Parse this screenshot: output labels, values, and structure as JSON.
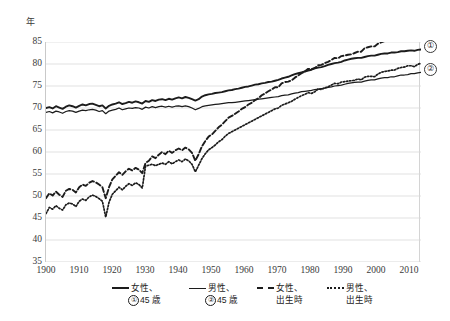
{
  "chart_data": {
    "type": "line",
    "title": "",
    "xlabel": "",
    "ylabel": "年",
    "unit_label": "年",
    "xlim": [
      1900,
      2013
    ],
    "ylim": [
      35,
      85
    ],
    "ytick_step": 5,
    "xtick_step": 10,
    "grid": "horizontal",
    "legend_position": "bottom",
    "xticks": [
      "1900",
      "1910",
      "1920",
      "1930",
      "1940",
      "1950",
      "1960",
      "1970",
      "1980",
      "1990",
      "2000",
      "2010"
    ],
    "yticks": [
      "85",
      "80",
      "75",
      "70",
      "65",
      "60",
      "55",
      "50",
      "45",
      "40",
      "35"
    ],
    "series": [
      {
        "name": "女性、①45歳",
        "key": "female_45",
        "style": "solid-thick",
        "callout": "①",
        "x": [
          1900,
          1901,
          1902,
          1903,
          1904,
          1905,
          1906,
          1907,
          1908,
          1909,
          1910,
          1911,
          1912,
          1913,
          1914,
          1915,
          1916,
          1917,
          1918,
          1919,
          1920,
          1921,
          1922,
          1923,
          1924,
          1925,
          1926,
          1927,
          1928,
          1929,
          1930,
          1931,
          1932,
          1933,
          1934,
          1935,
          1936,
          1937,
          1938,
          1939,
          1940,
          1941,
          1942,
          1943,
          1944,
          1945,
          1946,
          1947,
          1948,
          1949,
          1950,
          1951,
          1952,
          1953,
          1954,
          1955,
          1956,
          1957,
          1958,
          1959,
          1960,
          1961,
          1962,
          1963,
          1964,
          1965,
          1966,
          1967,
          1968,
          1969,
          1970,
          1971,
          1972,
          1973,
          1974,
          1975,
          1976,
          1977,
          1978,
          1979,
          1980,
          1981,
          1982,
          1983,
          1984,
          1985,
          1986,
          1987,
          1988,
          1989,
          1990,
          1991,
          1992,
          1993,
          1994,
          1995,
          1996,
          1997,
          1998,
          1999,
          2000,
          2001,
          2002,
          2003,
          2004,
          2005,
          2006,
          2007,
          2008,
          2009,
          2010,
          2011,
          2012,
          2013
        ],
        "y": [
          70.0,
          70.2,
          69.9,
          70.4,
          70.1,
          69.8,
          70.3,
          70.6,
          70.4,
          70.1,
          70.5,
          70.8,
          70.6,
          70.9,
          71.0,
          70.7,
          70.4,
          70.6,
          69.9,
          70.5,
          70.8,
          71.0,
          71.3,
          70.9,
          71.1,
          71.4,
          71.2,
          71.5,
          71.3,
          71.0,
          71.6,
          71.4,
          71.8,
          71.6,
          71.9,
          72.0,
          71.8,
          72.1,
          71.9,
          72.2,
          72.4,
          72.2,
          72.5,
          72.3,
          72.0,
          71.7,
          72.0,
          72.6,
          72.9,
          73.1,
          73.2,
          73.4,
          73.5,
          73.6,
          73.8,
          74.0,
          74.1,
          74.3,
          74.4,
          74.6,
          74.8,
          74.9,
          75.1,
          75.3,
          75.4,
          75.6,
          75.7,
          75.9,
          76.0,
          76.2,
          76.4,
          76.7,
          76.9,
          77.1,
          77.4,
          77.7,
          77.9,
          78.1,
          78.3,
          78.5,
          78.7,
          79.0,
          79.2,
          79.3,
          79.5,
          79.8,
          80.0,
          80.2,
          80.3,
          80.5,
          80.8,
          81.0,
          81.2,
          81.3,
          81.4,
          81.4,
          81.6,
          81.8,
          81.9,
          81.9,
          82.1,
          82.3,
          82.4,
          82.4,
          82.6,
          82.6,
          82.7,
          82.9,
          82.9,
          83.0,
          83.1,
          83.0,
          83.2,
          83.3
        ]
      },
      {
        "name": "男性、②45歳",
        "key": "male_45",
        "style": "solid-thin",
        "callout": "②",
        "x": [
          1900,
          1901,
          1902,
          1903,
          1904,
          1905,
          1906,
          1907,
          1908,
          1909,
          1910,
          1911,
          1912,
          1913,
          1914,
          1915,
          1916,
          1917,
          1918,
          1919,
          1920,
          1921,
          1922,
          1923,
          1924,
          1925,
          1926,
          1927,
          1928,
          1929,
          1930,
          1931,
          1932,
          1933,
          1934,
          1935,
          1936,
          1937,
          1938,
          1939,
          1940,
          1941,
          1942,
          1943,
          1944,
          1945,
          1946,
          1947,
          1948,
          1949,
          1950,
          1951,
          1952,
          1953,
          1954,
          1955,
          1956,
          1957,
          1958,
          1959,
          1960,
          1961,
          1962,
          1963,
          1964,
          1965,
          1966,
          1967,
          1968,
          1969,
          1970,
          1971,
          1972,
          1973,
          1974,
          1975,
          1976,
          1977,
          1978,
          1979,
          1980,
          1981,
          1982,
          1983,
          1984,
          1985,
          1986,
          1987,
          1988,
          1989,
          1990,
          1991,
          1992,
          1993,
          1994,
          1995,
          1996,
          1997,
          1998,
          1999,
          2000,
          2001,
          2002,
          2003,
          2004,
          2005,
          2006,
          2007,
          2008,
          2009,
          2010,
          2011,
          2012,
          2013
        ],
        "y": [
          69.0,
          69.2,
          68.9,
          69.3,
          69.1,
          68.8,
          69.2,
          69.4,
          69.3,
          69.0,
          69.3,
          69.5,
          69.4,
          69.6,
          69.7,
          69.5,
          69.2,
          69.4,
          68.7,
          69.3,
          69.5,
          69.7,
          70.0,
          69.6,
          69.8,
          70.0,
          69.9,
          70.1,
          70.0,
          69.7,
          70.2,
          70.0,
          70.3,
          70.1,
          70.3,
          70.4,
          70.2,
          70.4,
          70.2,
          70.4,
          70.5,
          70.3,
          70.5,
          70.3,
          70.0,
          69.6,
          69.9,
          70.3,
          70.5,
          70.6,
          70.7,
          70.8,
          70.9,
          71.0,
          71.1,
          71.2,
          71.2,
          71.3,
          71.4,
          71.5,
          71.6,
          71.7,
          71.8,
          71.9,
          72.0,
          72.1,
          72.2,
          72.3,
          72.4,
          72.5,
          72.6,
          72.8,
          72.9,
          73.0,
          73.2,
          73.4,
          73.5,
          73.7,
          73.8,
          73.9,
          74.0,
          74.2,
          74.3,
          74.4,
          74.5,
          74.7,
          74.8,
          75.0,
          75.1,
          75.2,
          75.4,
          75.6,
          75.7,
          75.8,
          75.9,
          75.9,
          76.1,
          76.3,
          76.4,
          76.4,
          76.6,
          76.8,
          76.9,
          76.9,
          77.1,
          77.1,
          77.3,
          77.5,
          77.5,
          77.6,
          77.8,
          77.8,
          78.0,
          78.1
        ]
      },
      {
        "name": "女性、出生時",
        "key": "female_birth",
        "style": "dashed",
        "callout": "",
        "x": [
          1900,
          1901,
          1902,
          1903,
          1904,
          1905,
          1906,
          1907,
          1908,
          1909,
          1910,
          1911,
          1912,
          1913,
          1914,
          1915,
          1916,
          1917,
          1918,
          1919,
          1920,
          1921,
          1922,
          1923,
          1924,
          1925,
          1926,
          1927,
          1928,
          1929,
          1930,
          1931,
          1932,
          1933,
          1934,
          1935,
          1936,
          1937,
          1938,
          1939,
          1940,
          1941,
          1942,
          1943,
          1944,
          1945,
          1946,
          1947,
          1948,
          1949,
          1950,
          1951,
          1952,
          1953,
          1954,
          1955,
          1956,
          1957,
          1958,
          1959,
          1960,
          1961,
          1962,
          1963,
          1964,
          1965,
          1966,
          1967,
          1968,
          1969,
          1970,
          1971,
          1972,
          1973,
          1974,
          1975,
          1976,
          1977,
          1978,
          1979,
          1980,
          1981,
          1982,
          1983,
          1984,
          1985,
          1986,
          1987,
          1988,
          1989,
          1990,
          1991,
          1992,
          1993,
          1994,
          1995,
          1996,
          1997,
          1998,
          1999,
          2000,
          2001,
          2002,
          2003,
          2004,
          2005,
          2006,
          2007,
          2008,
          2009,
          2010,
          2011,
          2012,
          2013
        ],
        "y": [
          49.5,
          50.6,
          50.1,
          51.0,
          50.3,
          49.8,
          51.2,
          51.6,
          51.4,
          50.8,
          52.0,
          52.6,
          52.3,
          53.0,
          53.4,
          53.1,
          52.6,
          52.0,
          49.5,
          52.0,
          53.8,
          54.6,
          55.4,
          54.8,
          55.6,
          56.2,
          55.8,
          56.4,
          56.0,
          55.2,
          57.5,
          58.0,
          59.0,
          58.6,
          59.4,
          60.0,
          59.5,
          60.3,
          59.8,
          60.4,
          60.8,
          60.4,
          61.0,
          60.6,
          59.8,
          58.0,
          59.5,
          61.3,
          62.5,
          63.5,
          64.0,
          64.8,
          65.6,
          66.2,
          67.0,
          67.8,
          68.2,
          68.7,
          69.2,
          69.8,
          70.2,
          70.8,
          71.2,
          71.8,
          72.2,
          72.9,
          73.3,
          73.8,
          74.2,
          74.7,
          74.7,
          75.6,
          75.9,
          76.0,
          76.3,
          76.9,
          77.4,
          77.9,
          78.3,
          78.9,
          78.8,
          79.1,
          79.7,
          79.8,
          80.2,
          80.5,
          80.9,
          81.4,
          81.3,
          81.8,
          81.9,
          82.1,
          82.2,
          82.5,
          82.8,
          82.8,
          83.6,
          83.8,
          84.0,
          84.0,
          84.6,
          84.9,
          85.2,
          85.3,
          85.6,
          85.5,
          85.8,
          86.0,
          86.1,
          86.4,
          86.3,
          85.9,
          86.4,
          86.6
        ]
      },
      {
        "name": "男性、出生時",
        "key": "male_birth",
        "style": "dotted",
        "callout": "",
        "x": [
          1900,
          1901,
          1902,
          1903,
          1904,
          1905,
          1906,
          1907,
          1908,
          1909,
          1910,
          1911,
          1912,
          1913,
          1914,
          1915,
          1916,
          1917,
          1918,
          1919,
          1920,
          1921,
          1922,
          1923,
          1924,
          1925,
          1926,
          1927,
          1928,
          1929,
          1930,
          1931,
          1932,
          1933,
          1934,
          1935,
          1936,
          1937,
          1938,
          1939,
          1940,
          1941,
          1942,
          1943,
          1944,
          1945,
          1946,
          1947,
          1948,
          1949,
          1950,
          1951,
          1952,
          1953,
          1954,
          1955,
          1956,
          1957,
          1958,
          1959,
          1960,
          1961,
          1962,
          1963,
          1964,
          1965,
          1966,
          1967,
          1968,
          1969,
          1970,
          1971,
          1972,
          1973,
          1974,
          1975,
          1976,
          1977,
          1978,
          1979,
          1980,
          1981,
          1982,
          1983,
          1984,
          1985,
          1986,
          1987,
          1988,
          1989,
          1990,
          1991,
          1992,
          1993,
          1994,
          1995,
          1996,
          1997,
          1998,
          1999,
          2000,
          2001,
          2002,
          2003,
          2004,
          2005,
          2006,
          2007,
          2008,
          2009,
          2010,
          2011,
          2012,
          2013
        ],
        "y": [
          46.0,
          47.4,
          47.0,
          47.8,
          47.2,
          46.8,
          48.0,
          48.4,
          48.2,
          47.6,
          48.8,
          49.3,
          49.0,
          49.8,
          50.2,
          49.9,
          49.4,
          48.8,
          45.2,
          48.6,
          50.4,
          51.2,
          52.0,
          51.4,
          52.2,
          52.8,
          52.4,
          53.0,
          52.6,
          51.8,
          56.8,
          57.0,
          57.2,
          56.9,
          57.2,
          57.5,
          57.2,
          57.8,
          57.3,
          57.8,
          58.2,
          57.8,
          58.4,
          58.0,
          57.2,
          55.5,
          57.0,
          58.5,
          59.6,
          60.5,
          61.0,
          61.6,
          62.3,
          62.8,
          63.6,
          64.2,
          64.6,
          65.0,
          65.4,
          65.8,
          66.2,
          66.6,
          67.0,
          67.4,
          67.8,
          68.2,
          68.6,
          69.0,
          69.4,
          69.8,
          70.0,
          70.6,
          70.9,
          71.2,
          71.5,
          72.0,
          72.4,
          72.8,
          73.1,
          73.5,
          73.3,
          73.7,
          74.3,
          74.2,
          74.6,
          74.8,
          75.2,
          75.6,
          75.5,
          75.9,
          76.0,
          76.1,
          76.2,
          76.3,
          76.6,
          76.4,
          77.0,
          77.2,
          77.2,
          77.1,
          77.7,
          78.1,
          78.3,
          78.4,
          78.6,
          78.6,
          79.0,
          79.2,
          79.3,
          79.6,
          79.6,
          79.4,
          79.9,
          80.2
        ]
      }
    ]
  },
  "callouts": [
    {
      "id": "callout-1",
      "symbol": "①"
    },
    {
      "id": "callout-2",
      "symbol": "②"
    }
  ],
  "legend": {
    "items": [
      {
        "line1": "女性、",
        "line2": "①45 歳",
        "style": "solid-thick",
        "circled": "①",
        "rest": "45 歳"
      },
      {
        "line1": "男性、",
        "line2": "②45 歳",
        "style": "solid-thin",
        "circled": "②",
        "rest": "45 歳"
      },
      {
        "line1": "女性、",
        "line2": "出生時",
        "style": "dashed",
        "circled": "",
        "rest": "出生時"
      },
      {
        "line1": "男性、",
        "line2": "出生時",
        "style": "dotted",
        "circled": "",
        "rest": "出生時"
      }
    ]
  }
}
